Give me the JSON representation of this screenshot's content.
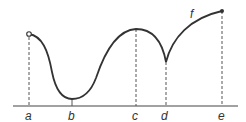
{
  "diagram": {
    "type": "function-graph",
    "colors": {
      "curve": "#333333",
      "axis": "#444444",
      "dashed": "#555555",
      "background": "#ffffff"
    },
    "axis": {
      "y": 106,
      "x_start": 13,
      "x_end": 238
    },
    "points": [
      {
        "id": "a",
        "label": "a",
        "x": 29,
        "y": 34,
        "marker": "open-circle"
      },
      {
        "id": "b",
        "label": "b",
        "x": 72,
        "y": 99,
        "marker": "none",
        "kind": "minimum"
      },
      {
        "id": "c",
        "label": "c",
        "x": 136,
        "y": 29,
        "marker": "none",
        "kind": "maximum"
      },
      {
        "id": "d",
        "label": "d",
        "x": 166,
        "y": 62,
        "marker": "none",
        "kind": "cusp"
      },
      {
        "id": "e",
        "label": "e",
        "x": 222,
        "y": 11,
        "marker": "filled-dot"
      }
    ],
    "curve_label": {
      "text": "f",
      "x": 190,
      "y": 18
    }
  }
}
